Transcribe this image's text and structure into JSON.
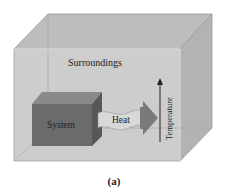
{
  "diagram": {
    "box_label": "Surroundings",
    "system_label": "System",
    "heat_label": "Heat",
    "axis_label": "Temperature",
    "caption": "(a)"
  },
  "colors": {
    "surroundings_front": "#c8c8c8",
    "surroundings_top": "#bdbdbd",
    "surroundings_side": "#b3b3b3",
    "system_front": "#6b6b6b",
    "system_top": "#8a8a8a",
    "system_side": "#575757",
    "heat_arrow": "#7a7a7a",
    "heat_band": "#d8d8d8"
  }
}
